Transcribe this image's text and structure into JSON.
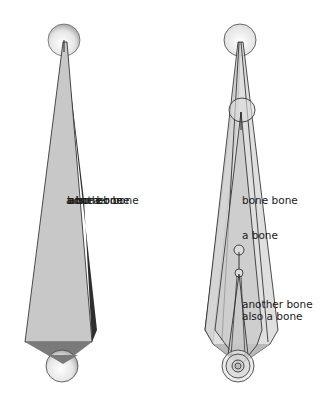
{
  "left_view": {
    "name": "solid bone view",
    "labels": [
      {
        "text": "a bone",
        "x": 66,
        "y": 204
      },
      {
        "text": "bone bone",
        "x": 67,
        "y": 204
      },
      {
        "text": "another bone",
        "x": 68,
        "y": 204
      },
      {
        "text": "also a bone",
        "x": 69,
        "y": 204
      }
    ],
    "colors": {
      "face": "#c8c8c8",
      "side": "#2e2e2e",
      "bottom": "#7a7a7a",
      "outline": "#222222"
    }
  },
  "right_view": {
    "name": "transparent bone view",
    "labels": [
      {
        "text": "bone bone",
        "x": 242,
        "y": 204
      },
      {
        "text": "a bone",
        "x": 242,
        "y": 239
      },
      {
        "text": "another bone",
        "x": 242,
        "y": 308
      },
      {
        "text": "also a bone",
        "x": 242,
        "y": 320
      }
    ],
    "colors": {
      "face": "#d9d9d9",
      "inner": "#c4c4c4",
      "outline": "#222222"
    }
  }
}
